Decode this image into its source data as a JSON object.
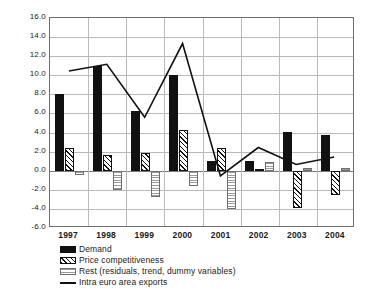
{
  "chart_data": {
    "type": "bar",
    "title": "",
    "subtitle": "",
    "xlabel": "",
    "ylabel": "",
    "categories": [
      "1997",
      "1998",
      "1999",
      "2000",
      "2001",
      "2002",
      "2003",
      "2004"
    ],
    "ylim": [
      -6.0,
      16.0
    ],
    "ytick_step": 2.0,
    "ytick_labels": [
      "16.0",
      "14.0",
      "12.0",
      "10.0",
      "8.0",
      "6.0",
      "4.0",
      "2.0",
      "0.0",
      "-2.0",
      "-4.0",
      "-6.0"
    ],
    "ytick_values": [
      16.0,
      14.0,
      12.0,
      10.0,
      8.0,
      6.0,
      4.0,
      2.0,
      0.0,
      -2.0,
      -4.0,
      -6.0
    ],
    "grid": true,
    "legend_position": "bottom-left",
    "series": [
      {
        "name": "Demand",
        "type": "bar",
        "style": "solid-black",
        "values": [
          8.0,
          11.0,
          6.3,
          10.0,
          1.0,
          1.0,
          4.1,
          3.7
        ]
      },
      {
        "name": "Price competitiveness",
        "type": "bar",
        "style": "diagonal-hatch",
        "values": [
          2.4,
          1.7,
          1.9,
          4.3,
          2.4,
          0.2,
          -3.9,
          -2.5
        ]
      },
      {
        "name": "Rest (residuals, trend, dummy variables)",
        "type": "bar",
        "style": "horizontal-hatch",
        "values": [
          -0.5,
          -2.0,
          -2.8,
          -1.6,
          -4.0,
          0.9,
          0.3,
          0.3
        ]
      },
      {
        "name": "Intra euro area exports",
        "type": "line",
        "style": "solid-line",
        "values": [
          10.4,
          11.1,
          5.5,
          13.3,
          -0.7,
          2.3,
          0.5,
          1.3
        ]
      }
    ]
  },
  "legend": {
    "items": [
      {
        "label": "Demand",
        "swatch": "solid-black-swatch"
      },
      {
        "label": "Price competitiveness",
        "swatch": "diagonal-hatch-swatch"
      },
      {
        "label": "Rest (residuals, trend, dummy variables)",
        "swatch": "horizontal-hatch-swatch"
      },
      {
        "label": "Intra euro area exports",
        "swatch": "line-swatch"
      }
    ]
  },
  "colors": {
    "demand": "#111111",
    "price_competitiveness": "#111111",
    "rest": "#9a9a9a",
    "line": "#111111",
    "grid": "#b9b9b9",
    "axis": "#6d6d6d",
    "background": "#ffffff"
  }
}
